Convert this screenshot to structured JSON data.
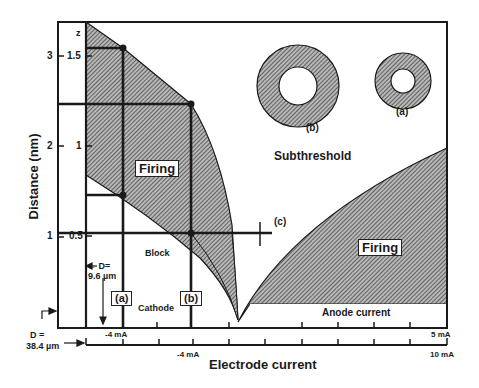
{
  "figure": {
    "y_axis": {
      "label": "Distance (nm)",
      "outer_ticks": [
        "3",
        "2",
        "1"
      ],
      "inner_ticks": [
        "1.5",
        "1",
        "0.5"
      ],
      "inner_top_label": "z"
    },
    "x_axis": {
      "label": "Electrode current",
      "upper_axis_ticks": {
        "left": "-4 mA",
        "right": "5 mA"
      },
      "lower_axis_ticks": {
        "left": "-4 mA",
        "right": "10 mA"
      }
    },
    "regions": {
      "firing_left": "Firing",
      "firing_right": "Firing",
      "subthreshold": "Subthreshold",
      "block": "Block",
      "cathode": "Cathode",
      "anode": "Anode current"
    },
    "markers": {
      "a_box": "(a)",
      "b_box": "(b)",
      "c_label": "(c)",
      "ring_a": "(a)",
      "ring_b": "(b)"
    },
    "annotations": {
      "d_small_line1": "← D=",
      "d_small_line2": "9.6 µm",
      "d_large_line1": "D =",
      "d_large_line2": "38.4 µm"
    },
    "colors": {
      "ink": "#1a1a1a",
      "hatch": "#555555",
      "background": "#ffffff"
    }
  }
}
